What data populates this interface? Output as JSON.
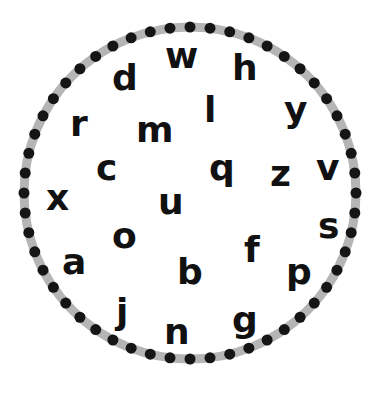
{
  "colors": {
    "ring": "#b5b5b5",
    "dots": "#151515",
    "letters": "#111111",
    "background": "#ffffff"
  },
  "ring": {
    "dot_count": 52
  },
  "letters": [
    {
      "char": "w",
      "row": "top"
    },
    {
      "char": "d",
      "row": "top"
    },
    {
      "char": "h",
      "row": "top"
    },
    {
      "char": "l",
      "row": "upper"
    },
    {
      "char": "y",
      "row": "upper"
    },
    {
      "char": "r",
      "row": "upper"
    },
    {
      "char": "m",
      "row": "upper"
    },
    {
      "char": "c",
      "row": "middle"
    },
    {
      "char": "q",
      "row": "middle"
    },
    {
      "char": "z",
      "row": "middle"
    },
    {
      "char": "v",
      "row": "middle"
    },
    {
      "char": "x",
      "row": "middle"
    },
    {
      "char": "u",
      "row": "middle"
    },
    {
      "char": "s",
      "row": "lower"
    },
    {
      "char": "o",
      "row": "lower"
    },
    {
      "char": "f",
      "row": "lower"
    },
    {
      "char": "a",
      "row": "lower"
    },
    {
      "char": "b",
      "row": "lower"
    },
    {
      "char": "p",
      "row": "lower"
    },
    {
      "char": "j",
      "row": "bottom"
    },
    {
      "char": "g",
      "row": "bottom"
    },
    {
      "char": "n",
      "row": "bottom"
    }
  ]
}
